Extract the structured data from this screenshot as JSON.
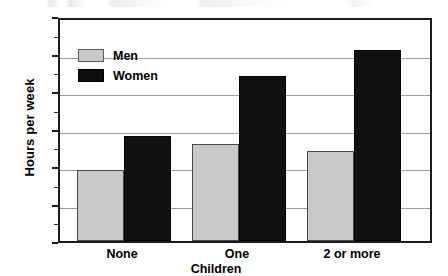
{
  "chart_data": {
    "type": "bar",
    "title": "",
    "xlabel": "Children",
    "ylabel": "Hours per week",
    "categories": [
      "None",
      "One",
      "2 or more"
    ],
    "series": [
      {
        "name": "Men",
        "color": "#c9c9c9",
        "values": [
          19,
          26,
          24
        ]
      },
      {
        "name": "Women",
        "color": "#111111",
        "values": [
          28,
          44,
          51
        ]
      }
    ],
    "ylim": [
      0,
      60
    ],
    "yticks": [
      0,
      10,
      20,
      30,
      40,
      50,
      60
    ],
    "ytick_labels": [
      "0",
      "10",
      "20",
      "30",
      "40",
      "50",
      "60"
    ],
    "grid": true,
    "grid_axis": "y",
    "legend_position": "upper-left-inside",
    "bar_group_mode": "grouped"
  },
  "axis": {
    "y_title": "Hours per week",
    "x_title": "Children",
    "y_ticks": [
      {
        "value": 60,
        "label": "60"
      },
      {
        "value": 50,
        "label": "50"
      },
      {
        "value": 40,
        "label": "40"
      },
      {
        "value": 30,
        "label": "30"
      },
      {
        "value": 20,
        "label": "20"
      },
      {
        "value": 10,
        "label": "10"
      },
      {
        "value": 0,
        "label": "0"
      }
    ],
    "x_ticks": [
      {
        "label": "None"
      },
      {
        "label": "One"
      },
      {
        "label": "2 or more"
      }
    ]
  },
  "legend": {
    "items": [
      {
        "label": "Men",
        "color": "#c9c9c9"
      },
      {
        "label": "Women",
        "color": "#111111"
      }
    ]
  },
  "bars": [
    {
      "group": "None",
      "series": "Men",
      "value": 19
    },
    {
      "group": "None",
      "series": "Women",
      "value": 28
    },
    {
      "group": "One",
      "series": "Men",
      "value": 26
    },
    {
      "group": "One",
      "series": "Women",
      "value": 44
    },
    {
      "group": "2 or more",
      "series": "Men",
      "value": 24
    },
    {
      "group": "2 or more",
      "series": "Women",
      "value": 51
    }
  ]
}
